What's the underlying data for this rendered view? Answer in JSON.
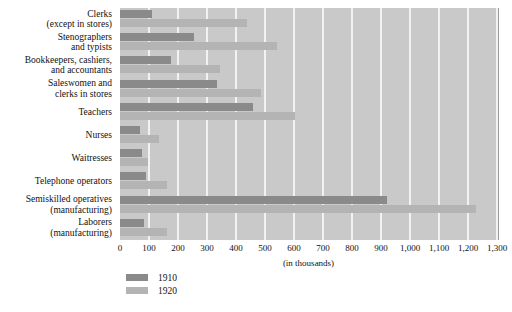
{
  "chart_data": {
    "type": "bar",
    "orientation": "horizontal",
    "title": "",
    "xlabel": "(in thousands)",
    "ylabel": "",
    "xlim": [
      0,
      1300
    ],
    "xticks": [
      0,
      100,
      200,
      300,
      400,
      500,
      600,
      700,
      800,
      900,
      1000,
      1100,
      1200,
      1300
    ],
    "xticklabels": [
      "0",
      "100",
      "200",
      "300",
      "400",
      "500",
      "600",
      "700",
      "800",
      "900",
      "1,000",
      "1,100",
      "1,200",
      "1,300"
    ],
    "grid": true,
    "grid_axis": "x",
    "legend_position": "below-left",
    "categories": [
      "Clerks\n(except in stores)",
      "Stenographers\nand typists",
      "Bookkeepers, cashiers,\nand accountants",
      "Saleswomen and\nclerks in stores",
      "Teachers",
      "Nurses",
      "Waitresses",
      "Telephone operators",
      "Semiskilled operatives\n(manufacturing)",
      "Laborers\n(manufacturing)"
    ],
    "series": [
      {
        "name": "1910",
        "color": "#8a8a8a",
        "values": [
          110,
          255,
          176,
          334,
          459,
          69,
          76,
          88,
          920,
          82
        ]
      },
      {
        "name": "1920",
        "color": "#b4b4b4",
        "values": [
          438,
          540,
          345,
          486,
          603,
          135,
          96,
          162,
          1228,
          162
        ]
      }
    ]
  },
  "colors": {
    "plot_background": "#c9c9c9",
    "gridline": "#f2f2f2",
    "series_1910": "#8a8a8a",
    "series_1920": "#b4b4b4",
    "page_background": "#ffffff",
    "text": "#111111"
  }
}
